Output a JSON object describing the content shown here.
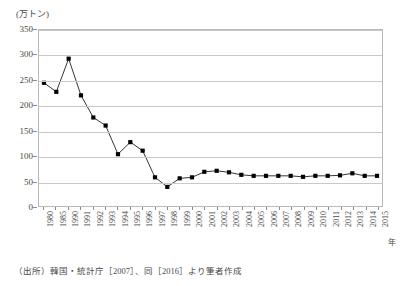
{
  "chart_data": {
    "type": "line",
    "title": "",
    "subtitle": "",
    "xlabel": "年",
    "ylabel": "(万トン)",
    "ylim": [
      0,
      350
    ],
    "ytick_step": 50,
    "yticks": [
      0,
      50,
      100,
      150,
      200,
      250,
      300,
      350
    ],
    "grid": true,
    "legend": null,
    "marker": "filled-square",
    "line_color": "#000000",
    "marker_color": "#000000",
    "grid_color": "#c9c9c9",
    "categories": [
      "1980",
      "1985",
      "1990",
      "1991",
      "1992",
      "1993",
      "1994",
      "1995",
      "1996",
      "1997",
      "1998",
      "1999",
      "2000",
      "2001",
      "2002",
      "2003",
      "2004",
      "2005",
      "2006",
      "2007",
      "2008",
      "2009",
      "2010",
      "2011",
      "2012",
      "2013",
      "2014",
      "2015"
    ],
    "values": [
      245,
      227,
      293,
      220,
      176,
      160,
      103,
      127,
      110,
      57,
      38,
      55,
      57,
      68,
      70,
      67,
      62,
      60,
      60,
      60,
      60,
      58,
      60,
      60,
      61,
      65,
      60,
      60
    ],
    "series": [
      {
        "name": "",
        "values": [
          245,
          227,
          293,
          220,
          176,
          160,
          103,
          127,
          110,
          57,
          38,
          55,
          57,
          68,
          70,
          67,
          62,
          60,
          60,
          60,
          60,
          58,
          60,
          60,
          61,
          65,
          60,
          60
        ]
      }
    ],
    "annotations": []
  },
  "axis": {
    "y_unit_label": "(万トン)",
    "x_unit_label": "年"
  },
  "source": {
    "caption": "（出所）韓国・統計庁［2007］、同［2016］より筆者作成"
  }
}
